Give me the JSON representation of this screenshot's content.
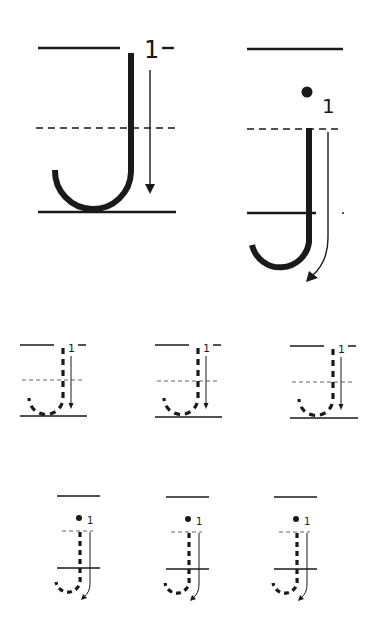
{
  "worksheet": {
    "subject": "Letter J handwriting practice",
    "models": [
      {
        "letter": "J",
        "case": "uppercase",
        "stroke_number": "1",
        "style": "solid"
      },
      {
        "letter": "j",
        "case": "lowercase",
        "stroke_number": "1",
        "style": "solid"
      }
    ],
    "tracing_rows": [
      {
        "letter": "J",
        "case": "uppercase",
        "count": 3,
        "stroke_number": "1",
        "style": "dashed"
      },
      {
        "letter": "j",
        "case": "lowercase",
        "count": 3,
        "stroke_number": "1",
        "style": "dashed"
      }
    ],
    "labels": {
      "big_upper_num": "1",
      "big_lower_num": "1",
      "trace_upper_nums": [
        "1",
        "1",
        "1"
      ],
      "trace_lower_nums": [
        "1",
        "1",
        "1"
      ]
    }
  }
}
